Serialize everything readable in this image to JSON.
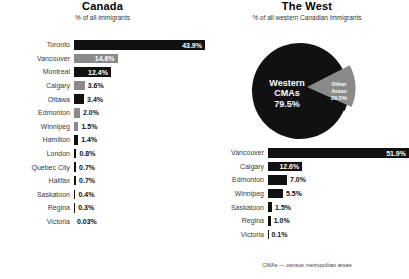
{
  "chart_data": [
    {
      "type": "bar",
      "title": "Canada",
      "subtitle": "% of all immigrants",
      "orientation": "horizontal",
      "xlabel": "",
      "ylabel": "",
      "xlim": [
        0,
        43.9
      ],
      "grid": false,
      "legend": "none",
      "categories": [
        "Toronto",
        "Vancouver",
        "Montreal",
        "Calgary",
        "Ottawa",
        "Edmonton",
        "Winnipeg",
        "Hamilton",
        "London",
        "Quebec City",
        "Halifax",
        "Saskatoon",
        "Regina",
        "Victoria"
      ],
      "values": [
        43.9,
        14.6,
        12.4,
        3.6,
        3.4,
        2.0,
        1.5,
        1.4,
        0.8,
        0.7,
        0.7,
        0.4,
        0.3,
        0.03
      ],
      "value_labels": [
        "43.9%",
        "14.6%",
        "12.4%",
        "3.6%",
        "3.4%",
        "2.0%",
        "1.5%",
        "1.4%",
        "0.8%",
        "0.7%",
        "0.7%",
        "0.4%",
        "0.3%",
        "0.03%"
      ],
      "bar_colors": [
        "#111111",
        "#8a8a8a",
        "#111111",
        "#8a8a8a",
        "#111111",
        "#8a8a8a",
        "#8a8a8a",
        "#111111",
        "#111111",
        "#111111",
        "#111111",
        "#111111",
        "#111111",
        "#111111"
      ],
      "label_placement": [
        "inside",
        "inside",
        "inside",
        "outside",
        "outside",
        "outside",
        "outside",
        "outside",
        "outside",
        "outside",
        "outside",
        "outside",
        "outside",
        "outside"
      ]
    },
    {
      "type": "pie",
      "title": "The West",
      "subtitle": "% of all western Canadian immigrants",
      "labels": [
        "Western CMAs",
        "Other Areas"
      ],
      "values": [
        79.5,
        20.5
      ],
      "value_labels": [
        "79.5%",
        "20.5%"
      ],
      "colors": [
        "#111111",
        "#8a8a8a"
      ],
      "exploded": [
        "Other Areas"
      ],
      "legend": "none"
    },
    {
      "type": "bar",
      "title": "",
      "subtitle": "",
      "orientation": "horizontal",
      "xlim": [
        0,
        51.9
      ],
      "grid": false,
      "legend": "none",
      "categories": [
        "Vancouver",
        "Calgary",
        "Edmonton",
        "Winnipeg",
        "Saskatoon",
        "Regina",
        "Victoria"
      ],
      "values": [
        51.9,
        12.6,
        7.0,
        5.5,
        1.5,
        1.0,
        0.1
      ],
      "value_labels": [
        "51.9%",
        "12.6%",
        "7.0%",
        "5.5%",
        "1.5%",
        "1.0%",
        "0.1%"
      ],
      "bar_colors": [
        "#111111",
        "#111111",
        "#111111",
        "#111111",
        "#111111",
        "#111111",
        "#111111"
      ],
      "label_placement": [
        "inside",
        "inside",
        "outside",
        "outside",
        "outside",
        "outside",
        "outside"
      ]
    }
  ],
  "canada": {
    "title": "Canada",
    "subtitle": "% of all immigrants",
    "rows": [
      {
        "label": "Toronto",
        "value": "43.9%",
        "width": "100%",
        "color": "dark",
        "place": "inside"
      },
      {
        "label": "Vancouver",
        "value": "14.6%",
        "width": "33.3%",
        "color": "gray",
        "place": "inside"
      },
      {
        "label": "Montreal",
        "value": "12.4%",
        "width": "28.2%",
        "color": "dark",
        "place": "inside"
      },
      {
        "label": "Calgary",
        "value": "3.6%",
        "width": "8.2%",
        "color": "gray",
        "place": "outside"
      },
      {
        "label": "Ottawa",
        "value": "3.4%",
        "width": "7.7%",
        "color": "dark",
        "place": "outside"
      },
      {
        "label": "Edmonton",
        "value": "2.0%",
        "width": "4.6%",
        "color": "gray",
        "place": "outside"
      },
      {
        "label": "Winnipeg",
        "value": "1.5%",
        "width": "3.4%",
        "color": "gray",
        "place": "outside"
      },
      {
        "label": "Hamilton",
        "value": "1.4%",
        "width": "3.2%",
        "color": "dark",
        "place": "outside"
      },
      {
        "label": "London",
        "value": "0.8%",
        "width": "1.9%",
        "color": "dark",
        "place": "outside"
      },
      {
        "label": "Quebec City",
        "value": "0.7%",
        "width": "1.6%",
        "color": "dark",
        "place": "outside"
      },
      {
        "label": "Halifax",
        "value": "0.7%",
        "width": "1.6%",
        "color": "dark",
        "place": "outside"
      },
      {
        "label": "Saskatoon",
        "value": "0.4%",
        "width": "1.1%",
        "color": "dark",
        "place": "outside"
      },
      {
        "label": "Regina",
        "value": "0.3%",
        "width": "0.9%",
        "color": "dark",
        "place": "outside"
      },
      {
        "label": "Victoria",
        "value": "0.03%",
        "width": "0%",
        "color": "dark",
        "place": "outside"
      }
    ]
  },
  "west": {
    "title": "The West",
    "subtitle": "% of all western Canadian immigrants",
    "pie": {
      "main_label_line1": "Western",
      "main_label_line2": "CMAs",
      "main_value": "79.5%",
      "other_label_line1": "Other",
      "other_label_line2": "Areas",
      "other_value": "20.5%"
    },
    "rows": [
      {
        "label": "Vancouver",
        "value": "51.9%",
        "width": "100%",
        "color": "dark",
        "place": "inside"
      },
      {
        "label": "Calgary",
        "value": "12.6%",
        "width": "24.3%",
        "color": "dark",
        "place": "inside"
      },
      {
        "label": "Edmonton",
        "value": "7.0%",
        "width": "13.5%",
        "color": "dark",
        "place": "outside"
      },
      {
        "label": "Winnipeg",
        "value": "5.5%",
        "width": "10.6%",
        "color": "dark",
        "place": "outside"
      },
      {
        "label": "Saskatoon",
        "value": "1.5%",
        "width": "2.9%",
        "color": "dark",
        "place": "outside"
      },
      {
        "label": "Regina",
        "value": "1.0%",
        "width": "1.9%",
        "color": "dark",
        "place": "outside"
      },
      {
        "label": "Victoria",
        "value": "0.1%",
        "width": "0.3%",
        "color": "dark",
        "place": "outside"
      }
    ]
  },
  "footnote": "CMAs — census metropolitan areas"
}
